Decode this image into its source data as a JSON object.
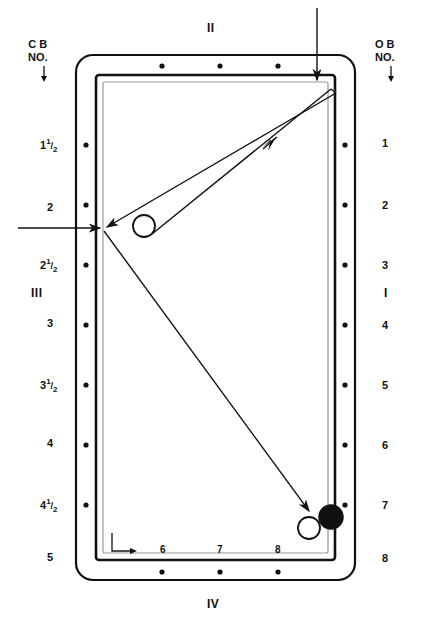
{
  "diagram": {
    "title_top": "II",
    "title_bottom": "IV",
    "title_left": "III",
    "title_right": "I",
    "left_header": "C B\nNO.",
    "left_header_line1": "C B",
    "left_header_line2": "NO.",
    "right_header_line1": "O B",
    "right_header_line2": "NO.",
    "left_arrow_icon": "down-arrow-icon",
    "right_arrow_icon": "down-arrow-icon"
  },
  "left_scale": [
    {
      "whole": "1",
      "num": "1",
      "den": "2",
      "y": 145
    },
    {
      "whole": "2",
      "num": "",
      "den": "",
      "y": 208
    },
    {
      "whole": "2",
      "num": "1",
      "den": "2",
      "y": 263
    },
    {
      "whole": "3",
      "num": "",
      "den": "",
      "y": 323
    },
    {
      "whole": "3",
      "num": "1",
      "den": "2",
      "y": 383
    },
    {
      "whole": "4",
      "num": "",
      "den": "",
      "y": 443
    },
    {
      "whole": "4",
      "num": "1",
      "den": "2",
      "y": 503
    },
    {
      "whole": "5",
      "num": "",
      "den": "",
      "y": 557
    }
  ],
  "right_scale": [
    "1",
    "2",
    "3",
    "4",
    "5",
    "6",
    "7",
    "8"
  ],
  "bottom_scale": [
    "6",
    "7",
    "8"
  ],
  "balls": [
    {
      "name": "cue-ball",
      "type": "open",
      "cx": 144,
      "cy": 226,
      "r": 11
    },
    {
      "name": "object-ball-white",
      "type": "open",
      "cx": 309,
      "cy": 528,
      "r": 11
    },
    {
      "name": "object-ball-black",
      "type": "filled",
      "cx": 331,
      "cy": 517,
      "r": 12
    }
  ],
  "colors": {
    "line": "#111111",
    "rail": "#000000",
    "cloth": "#ffffff",
    "cushion": "#9a9a9a"
  },
  "rail_dots": {
    "top_count": 3,
    "bottom_count": 3,
    "left_count": 7,
    "right_count": 7
  },
  "shot_lines": [
    {
      "name": "entry-arrow-top",
      "from": [
        317,
        8
      ],
      "to": [
        317,
        78
      ],
      "arrow": "end"
    },
    {
      "name": "entry-arrow-left",
      "from": [
        18,
        228
      ],
      "to": [
        102,
        228
      ],
      "arrow": "end"
    },
    {
      "name": "cue-to-corner",
      "from": [
        150,
        233
      ],
      "to": [
        330,
        88
      ],
      "arrow": "mid"
    },
    {
      "name": "corner-to-rail",
      "from": [
        333,
        92
      ],
      "to": [
        105,
        227
      ],
      "arrow": "end"
    },
    {
      "name": "rail-to-object",
      "from": [
        103,
        230
      ],
      "to": [
        310,
        512
      ],
      "arrow": "end"
    }
  ]
}
